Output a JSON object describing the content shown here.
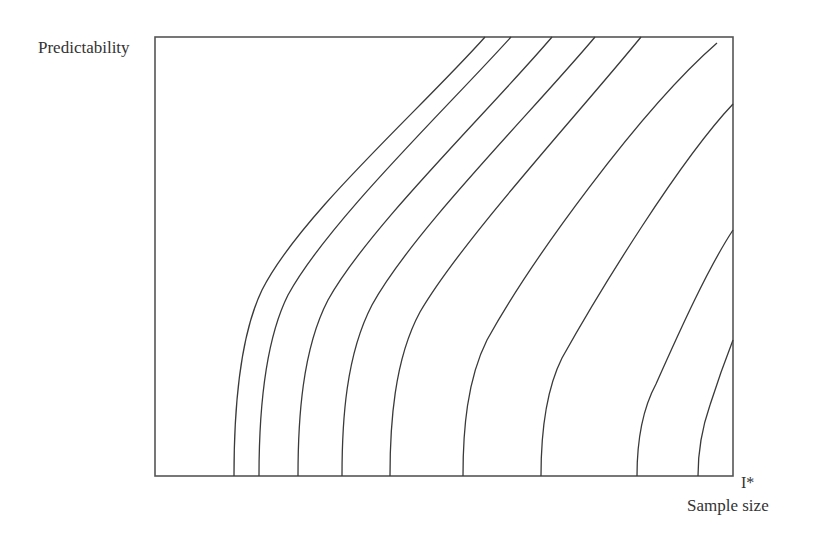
{
  "chart_data": {
    "type": "line",
    "title": "",
    "ylabel": "Predictability",
    "xlabel": "Sample size",
    "x_marker": "I*",
    "grid": false,
    "legend": null,
    "frame": {
      "left": 155,
      "top": 37,
      "right": 733,
      "bottom": 476
    },
    "line_color": "#3a3a3a",
    "frame_color": "#555555",
    "series": [
      {
        "name": "curve-1",
        "path": "M234,476 C234,420 238,340 262,290 C300,215 420,110 485,37"
      },
      {
        "name": "curve-2",
        "path": "M259,476 C259,420 263,345 288,295 C328,222 445,110 511,37"
      },
      {
        "name": "curve-3",
        "path": "M298,476 C298,420 302,350 328,300 C368,228 488,112 552,37"
      },
      {
        "name": "curve-4",
        "path": "M342,476 C342,420 346,355 372,305 C412,232 532,112 595,37"
      },
      {
        "name": "curve-5",
        "path": "M390,476 C390,425 394,360 420,312 C462,240 580,112 641,37"
      },
      {
        "name": "curve-6",
        "path": "M463,476 C463,430 467,380 487,340 C530,262 640,110 717,43"
      },
      {
        "name": "curve-7",
        "path": "M541,476 C541,435 546,390 562,358 C600,290 680,160 733,104"
      },
      {
        "name": "curve-8",
        "path": "M637,476 C637,445 642,410 656,384 C680,330 708,268 733,230"
      },
      {
        "name": "curve-9",
        "path": "M698,476 C698,455 702,428 710,405 C718,380 726,358 733,340"
      }
    ]
  }
}
